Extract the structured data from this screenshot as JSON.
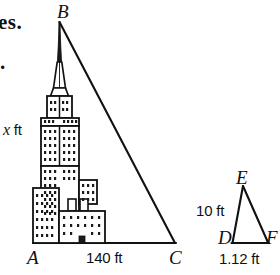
{
  "figure": {
    "title_fragment": "es.",
    "bullet_marker": ".",
    "background_color": "#ffffff",
    "line_color": "#111111"
  },
  "large_triangle": {
    "name": "triangle-ABC",
    "vertices": [
      {
        "id": "B",
        "label": "B",
        "x": 59,
        "y": 22,
        "position": "apex-top"
      },
      {
        "id": "A",
        "label": "A",
        "x": 36,
        "y": 243,
        "position": "bottom-left"
      },
      {
        "id": "C",
        "label": "C",
        "x": 175,
        "y": 243,
        "position": "bottom-right"
      }
    ],
    "sides": [
      {
        "from": "A",
        "to": "B",
        "label": "x ft",
        "value": "x",
        "unit": "ft",
        "orientation": "vertical-left"
      },
      {
        "from": "A",
        "to": "C",
        "label": "140 ft",
        "value": "140",
        "unit": "ft",
        "orientation": "horizontal-base"
      },
      {
        "from": "B",
        "to": "C",
        "label": "",
        "value": "",
        "unit": "",
        "orientation": "hypotenuse"
      }
    ],
    "height_label": "x ft",
    "base_label": "140 ft",
    "vertex_A_label": "A",
    "vertex_B_label": "B",
    "vertex_C_label": "C"
  },
  "small_triangle": {
    "name": "triangle-DEF",
    "vertices": [
      {
        "id": "E",
        "label": "E",
        "x": 243,
        "y": 186,
        "position": "apex-top"
      },
      {
        "id": "D",
        "label": "D",
        "x": 232,
        "y": 243,
        "position": "bottom-left"
      },
      {
        "id": "F",
        "label": "F",
        "x": 268,
        "y": 242,
        "position": "bottom-right"
      }
    ],
    "sides": [
      {
        "from": "D",
        "to": "E",
        "label": "10 ft",
        "value": "10",
        "unit": "ft",
        "orientation": "vertical-left"
      },
      {
        "from": "D",
        "to": "F",
        "label": "1.12 ft",
        "value": "1.12",
        "unit": "ft",
        "orientation": "horizontal-base"
      },
      {
        "from": "E",
        "to": "F",
        "label": "",
        "value": "",
        "unit": "",
        "orientation": "hypotenuse"
      }
    ],
    "height_label": "10 ft",
    "base_label": "1.12 ft",
    "vertex_D_label": "D",
    "vertex_E_label": "E",
    "vertex_F_label": "F"
  },
  "building_illustration": {
    "name": "skyscraper-empire-state-style",
    "description": "tiered skyscraper with antenna spire, window dot grid, stepped setbacks",
    "window_color": "#1a1a1a",
    "wall_color": "#ffffff",
    "outline_color": "#111111"
  }
}
